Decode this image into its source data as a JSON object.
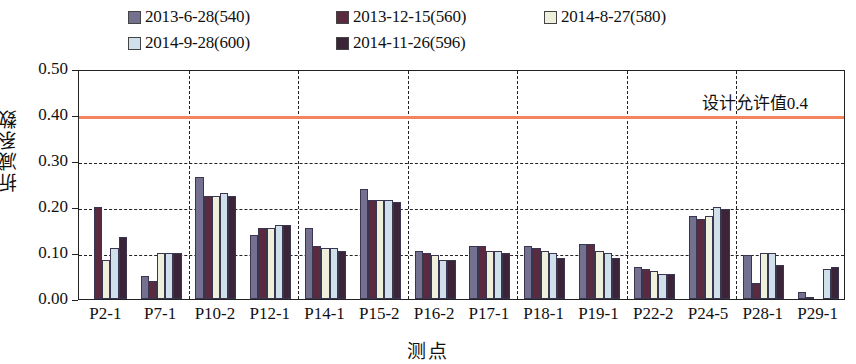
{
  "chart_data": {
    "type": "bar",
    "title": "",
    "xlabel": "测点",
    "ylabel": "折减系数",
    "ylim": [
      0.0,
      0.5
    ],
    "ytick_labels": [
      "0.00",
      "0.10",
      "0.20",
      "0.30",
      "0.40",
      "0.50"
    ],
    "ytick_values": [
      0.0,
      0.1,
      0.2,
      0.3,
      0.4,
      0.5
    ],
    "grid": "horizontal-dashed-and-vertical-dashed",
    "legend_position": "top",
    "categories": [
      "P2-1",
      "P7-1",
      "P10-2",
      "P12-1",
      "P14-1",
      "P15-2",
      "P16-2",
      "P17-1",
      "P18-1",
      "P19-1",
      "P22-2",
      "P24-5",
      "P28-1",
      "P29-1"
    ],
    "series": [
      {
        "name": "2013-6-28(540)",
        "color": "#74708f",
        "values": [
          null,
          0.05,
          0.265,
          0.14,
          0.155,
          0.24,
          0.105,
          0.115,
          0.115,
          0.12,
          0.07,
          0.18,
          0.095,
          0.015
        ]
      },
      {
        "name": "2013-12-15(560)",
        "color": "#5a2b3f",
        "values": [
          0.2,
          0.04,
          0.225,
          0.155,
          0.115,
          0.215,
          0.1,
          0.115,
          0.11,
          0.12,
          0.065,
          0.175,
          0.035,
          0.005
        ]
      },
      {
        "name": "2014-8-27(580)",
        "color": "#eff0dc",
        "values": [
          0.085,
          0.1,
          0.225,
          0.155,
          0.11,
          0.215,
          0.095,
          0.105,
          0.105,
          0.105,
          0.06,
          0.18,
          0.1,
          null
        ]
      },
      {
        "name": "2014-9-28(600)",
        "color": "#cfe0ea",
        "values": [
          0.11,
          0.1,
          0.23,
          0.16,
          0.11,
          0.215,
          0.085,
          0.105,
          0.1,
          0.1,
          0.055,
          0.2,
          0.1,
          0.065
        ]
      },
      {
        "name": "2014-11-26(596)",
        "color": "#3b2338",
        "values": [
          0.135,
          0.1,
          0.225,
          0.16,
          0.105,
          0.21,
          0.085,
          0.1,
          0.09,
          0.09,
          0.055,
          0.195,
          0.075,
          0.07
        ]
      }
    ],
    "annotations": [
      {
        "text": "设计允许值0.4",
        "value": 0.4,
        "line_color": "#f4845f",
        "type": "horizontal-threshold-line"
      }
    ]
  }
}
